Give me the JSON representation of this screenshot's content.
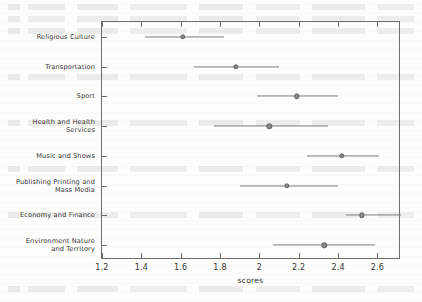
{
  "figure": {
    "x_axis_title": "scores",
    "background_artifact": "faint-show-through-text"
  },
  "chart_data": {
    "type": "scatter",
    "title": "",
    "subtitle": "",
    "xlabel": "scores",
    "ylabel": "",
    "orientation": "horizontal",
    "grid": false,
    "legend": null,
    "xlim": [
      1.2,
      2.72
    ],
    "xticks": [
      1.2,
      1.4,
      1.6,
      1.8,
      2,
      2.2,
      2.4,
      2.6
    ],
    "xticklabels": [
      "1.2",
      "1.4",
      "1.6",
      "1.8",
      "2",
      "2.2",
      "2.4",
      "2.6"
    ],
    "categories": [
      "Religious Culture",
      "Transportation",
      "Sport",
      "Health and Health\nServices",
      "Music and Shows",
      "Publishing Printing and\nMass Media",
      "Economy and Finance",
      "Environment Nature\nand Territory"
    ],
    "values": [
      1.61,
      1.88,
      2.19,
      2.05,
      2.42,
      2.14,
      2.52,
      2.33
    ],
    "ci_low": [
      1.42,
      1.67,
      1.99,
      1.77,
      2.24,
      1.9,
      2.44,
      2.07
    ],
    "ci_high": [
      1.82,
      2.1,
      2.4,
      2.35,
      2.61,
      2.4,
      2.72,
      2.59
    ],
    "marker": "filled-circle",
    "series": [
      {
        "name": "mean score with confidence interval",
        "values": [
          1.61,
          1.88,
          2.19,
          2.05,
          2.42,
          2.14,
          2.52,
          2.33
        ]
      }
    ],
    "colors": {
      "marker": "#8a8a8a",
      "line": "#7d7d7d",
      "axis": "#6d6d6d",
      "text": "#363636"
    }
  }
}
